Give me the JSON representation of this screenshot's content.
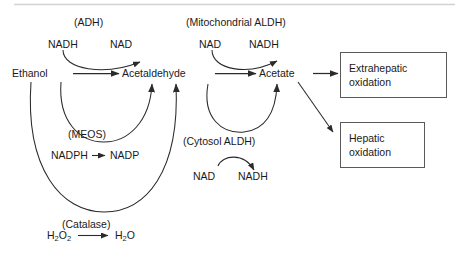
{
  "diagram": {
    "divider_color": "#d0d0d0",
    "line_color": "#2b2b2b",
    "box_border_color": "#5a5a5a",
    "text_color": "#1a1a1a"
  },
  "enzymes": {
    "adh": "(ADH)",
    "meos": "(MEOS)",
    "catalase": "(Catalase)",
    "mitochondrial_aldh": "(Mitochondrial ALDH)",
    "cytosol_aldh": "(Cytosol ALDH)"
  },
  "metabolites": {
    "ethanol": "Ethanol",
    "acetaldehyde": "Acetaldehyde",
    "acetate": "Acetate"
  },
  "cofactors": {
    "adh_in": "NADH",
    "adh_out": "NAD",
    "meos_in": "NADPH",
    "meos_out": "NADP",
    "mito_in": "NAD",
    "mito_out": "NADH",
    "cytosol_in": "NAD",
    "cytosol_out": "NADH"
  },
  "catalase_reaction": {
    "substrate_formula": "H",
    "substrate_sub1": "2",
    "substrate_mid": "O",
    "substrate_sub2": "2",
    "product_formula": "H",
    "product_sub1": "2",
    "product_mid": "O"
  },
  "outcomes": [
    {
      "label": "Extrahepatic\noxidation",
      "name": "extrahepatic-oxidation"
    },
    {
      "label": "Hepatic\noxidation",
      "name": "hepatic-oxidation"
    }
  ]
}
